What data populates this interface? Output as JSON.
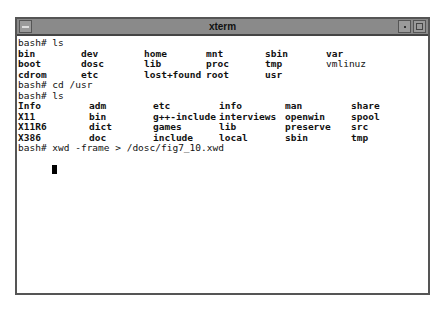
{
  "window": {
    "title": "xterm",
    "buttons": [
      "window-menu",
      "minimize",
      "maximize"
    ]
  },
  "terminal": {
    "prompt": "bash#",
    "commands": [
      "bash# ls",
      "bash# cd /usr",
      "bash# ls",
      "bash# xwd -frame > /dosc/fig7_10.xwd"
    ],
    "ls_root": [
      [
        "bin",
        "dev",
        "home",
        "mnt",
        "sbin",
        "var"
      ],
      [
        "boot",
        "dosc",
        "lib",
        "proc",
        "tmp",
        "vmlinuz"
      ],
      [
        "cdrom",
        "etc",
        "lost+found",
        "root",
        "usr",
        ""
      ]
    ],
    "ls_usr": [
      [
        "Info",
        "adm",
        "etc",
        "info",
        "man",
        "share"
      ],
      [
        "X11",
        "bin",
        "g++-include",
        "interviews",
        "openwin",
        "spool"
      ],
      [
        "X11R6",
        "dict",
        "games",
        "lib",
        "preserve",
        "src"
      ],
      [
        "X386",
        "doc",
        "include",
        "local",
        "sbin",
        "tmp"
      ]
    ]
  }
}
